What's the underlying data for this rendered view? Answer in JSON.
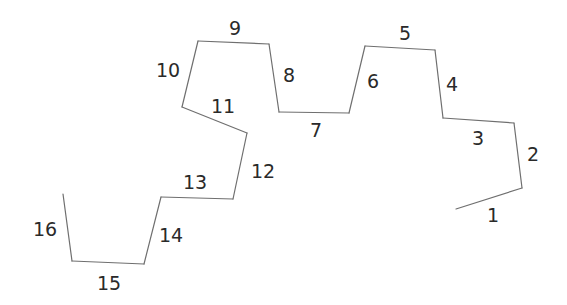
{
  "diagram": {
    "type": "numbered-polyline",
    "line_color": "#6f6f6f",
    "label_color": "#2a2a2a",
    "segments": [
      {
        "id": "1",
        "label": "1",
        "x1": 456,
        "y1": 209,
        "x2": 522,
        "y2": 188,
        "lx": 493,
        "ly": 215
      },
      {
        "id": "2",
        "label": "2",
        "x1": 522,
        "y1": 188,
        "x2": 514,
        "y2": 123,
        "lx": 533,
        "ly": 154
      },
      {
        "id": "3",
        "label": "3",
        "x1": 514,
        "y1": 123,
        "x2": 443,
        "y2": 118,
        "lx": 478,
        "ly": 138
      },
      {
        "id": "4",
        "label": "4",
        "x1": 443,
        "y1": 118,
        "x2": 435,
        "y2": 50,
        "lx": 452,
        "ly": 84
      },
      {
        "id": "5",
        "label": "5",
        "x1": 435,
        "y1": 50,
        "x2": 365,
        "y2": 46,
        "lx": 405,
        "ly": 33
      },
      {
        "id": "6",
        "label": "6",
        "x1": 365,
        "y1": 46,
        "x2": 349,
        "y2": 113,
        "lx": 373,
        "ly": 81
      },
      {
        "id": "7",
        "label": "7",
        "x1": 349,
        "y1": 113,
        "x2": 279,
        "y2": 112,
        "lx": 316,
        "ly": 130
      },
      {
        "id": "8",
        "label": "8",
        "x1": 279,
        "y1": 112,
        "x2": 269,
        "y2": 44,
        "lx": 289,
        "ly": 75
      },
      {
        "id": "9",
        "label": "9",
        "x1": 269,
        "y1": 44,
        "x2": 198,
        "y2": 41,
        "lx": 235,
        "ly": 28
      },
      {
        "id": "10",
        "label": "10",
        "x1": 198,
        "y1": 41,
        "x2": 182,
        "y2": 107,
        "lx": 168,
        "ly": 70
      },
      {
        "id": "11",
        "label": "11",
        "x1": 182,
        "y1": 107,
        "x2": 247,
        "y2": 133,
        "lx": 223,
        "ly": 106
      },
      {
        "id": "12",
        "label": "12",
        "x1": 247,
        "y1": 133,
        "x2": 233,
        "y2": 199,
        "lx": 263,
        "ly": 171
      },
      {
        "id": "13",
        "label": "13",
        "x1": 233,
        "y1": 199,
        "x2": 161,
        "y2": 197,
        "lx": 195,
        "ly": 182
      },
      {
        "id": "14",
        "label": "14",
        "x1": 161,
        "y1": 197,
        "x2": 144,
        "y2": 264,
        "lx": 171,
        "ly": 235
      },
      {
        "id": "15",
        "label": "15",
        "x1": 144,
        "y1": 264,
        "x2": 72,
        "y2": 261,
        "lx": 109,
        "ly": 283
      },
      {
        "id": "16",
        "label": "16",
        "x1": 72,
        "y1": 261,
        "x2": 63,
        "y2": 194,
        "lx": 45,
        "ly": 229
      }
    ]
  }
}
